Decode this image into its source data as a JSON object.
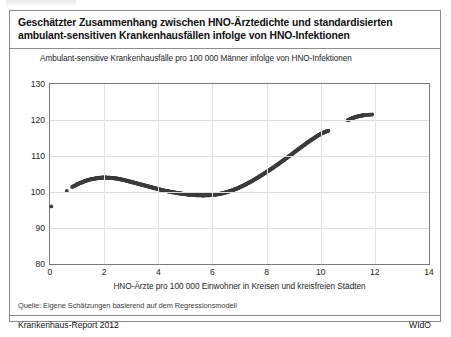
{
  "card": {
    "title_line1": "Geschätzter Zusammenhang zwischen HNO-Ärztedichte und standardisierten",
    "title_line2": "ambulant-sensitiven Krankenhausfällen infolge von HNO-Infektionen",
    "source": "Quelle: Eigene Schätzungen basierend auf dem Regressionsmodell",
    "report": "Krankenhaus-Report 2012",
    "publisher": "WIdO"
  },
  "chart_data": {
    "type": "scatter",
    "title": "Geschätzter Zusammenhang zwischen HNO-Ärztedichte und standardisierten ambulant-sensitiven Krankenhausfällen infolge von HNO-Infektionen",
    "subtitle": "Ambulant-sensitive Krankenhausfälle pro 100 000 Männer infolge von HNO-Infektionen",
    "xlabel": "HNO-Ärzte pro 100 000 Einwohner in Kreisen und kreisfreien Städten",
    "ylabel": "Ambulant-sensitive Krankenhausfälle pro 100 000 Männer infolge von HNO-Infektionen",
    "xlim": [
      0,
      14
    ],
    "ylim": [
      80,
      130
    ],
    "xticks": [
      0,
      2,
      4,
      6,
      8,
      10,
      12,
      14
    ],
    "yticks": [
      80,
      90,
      100,
      110,
      120,
      130
    ],
    "grid": true,
    "legend": null,
    "marker_color": "#3c3c3c",
    "series": [
      {
        "name": "Geschätzte Fallzahl (Regressionsmodell)",
        "x": [
          0.05,
          0.62,
          0.82,
          0.95,
          1.05,
          1.15,
          1.25,
          1.35,
          1.45,
          1.55,
          1.65,
          1.75,
          1.85,
          1.95,
          2.05,
          2.15,
          2.25,
          2.35,
          2.45,
          2.55,
          2.65,
          2.75,
          2.85,
          2.95,
          3.05,
          3.15,
          3.25,
          3.35,
          3.45,
          3.55,
          3.65,
          3.75,
          3.85,
          3.95,
          4.05,
          4.15,
          4.25,
          4.35,
          4.45,
          4.55,
          4.65,
          4.75,
          4.85,
          4.95,
          5.05,
          5.15,
          5.25,
          5.35,
          5.45,
          5.55,
          5.65,
          5.75,
          5.85,
          5.95,
          6.05,
          6.15,
          6.25,
          6.35,
          6.45,
          6.55,
          6.65,
          6.75,
          6.85,
          6.95,
          7.05,
          7.15,
          7.25,
          7.35,
          7.45,
          7.55,
          7.65,
          7.75,
          7.85,
          7.95,
          8.05,
          8.15,
          8.25,
          8.35,
          8.45,
          8.55,
          8.65,
          8.75,
          8.85,
          8.95,
          9.05,
          9.15,
          9.25,
          9.35,
          9.45,
          9.55,
          9.65,
          9.75,
          9.85,
          9.95,
          10.05,
          10.15,
          10.28,
          11.0,
          11.1,
          11.2,
          11.3,
          11.4,
          11.5,
          11.6,
          11.9
        ],
        "y": [
          96.0,
          100.3,
          101.4,
          101.9,
          102.3,
          102.6,
          102.9,
          103.2,
          103.4,
          103.6,
          103.7,
          103.85,
          103.95,
          104.0,
          104.0,
          103.98,
          103.92,
          103.85,
          103.75,
          103.6,
          103.45,
          103.3,
          103.1,
          102.9,
          102.7,
          102.5,
          102.3,
          102.1,
          101.9,
          101.7,
          101.5,
          101.3,
          101.1,
          100.9,
          100.7,
          100.5,
          100.35,
          100.2,
          100.05,
          99.9,
          99.78,
          99.66,
          99.55,
          99.45,
          99.35,
          99.27,
          99.2,
          99.14,
          99.1,
          99.07,
          99.06,
          99.07,
          99.1,
          99.15,
          99.22,
          99.32,
          99.45,
          99.6,
          99.8,
          100.0,
          100.25,
          100.5,
          100.8,
          101.1,
          101.45,
          101.8,
          102.2,
          102.6,
          103.0,
          103.45,
          103.9,
          104.35,
          104.85,
          105.3,
          105.8,
          106.3,
          106.8,
          107.3,
          107.85,
          108.4,
          108.95,
          109.5,
          110.05,
          110.6,
          111.2,
          111.75,
          112.3,
          112.85,
          113.4,
          113.95,
          114.45,
          114.95,
          115.45,
          115.9,
          116.35,
          116.7,
          117.0,
          119.9,
          120.3,
          120.6,
          120.85,
          121.05,
          121.2,
          121.35,
          121.5
        ]
      }
    ]
  },
  "axes": {
    "yticks": [
      "130",
      "120",
      "110",
      "100",
      "90",
      "80"
    ],
    "xticks": [
      "0",
      "2",
      "4",
      "6",
      "8",
      "10",
      "12",
      "14"
    ]
  }
}
